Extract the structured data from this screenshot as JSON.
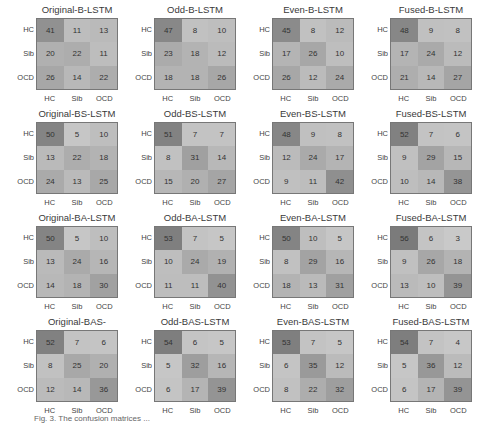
{
  "chart_data": [
    {
      "type": "heatmap",
      "title": "Original-B-LSTM",
      "x": [
        "HC",
        "Sib",
        "OCD"
      ],
      "y": [
        "HC",
        "Sib",
        "OCD"
      ],
      "values": [
        [
          41,
          11,
          13
        ],
        [
          20,
          22,
          11
        ],
        [
          26,
          14,
          22
        ]
      ]
    },
    {
      "type": "heatmap",
      "title": "Odd-B-LSTM",
      "x": [
        "HC",
        "Sib",
        "OCD"
      ],
      "y": [
        "HC",
        "Sib",
        "OCD"
      ],
      "values": [
        [
          47,
          8,
          10
        ],
        [
          23,
          18,
          12
        ],
        [
          18,
          18,
          26
        ]
      ]
    },
    {
      "type": "heatmap",
      "title": "Even-B-LSTM",
      "x": [
        "HC",
        "Sib",
        "OCD"
      ],
      "y": [
        "HC",
        "Sib",
        "OCD"
      ],
      "values": [
        [
          45,
          8,
          12
        ],
        [
          17,
          26,
          10
        ],
        [
          26,
          12,
          24
        ]
      ]
    },
    {
      "type": "heatmap",
      "title": "Fused-B-LSTM",
      "x": [
        "HC",
        "Sib",
        "OCD"
      ],
      "y": [
        "HC",
        "Sib",
        "OCD"
      ],
      "values": [
        [
          48,
          9,
          8
        ],
        [
          17,
          24,
          12
        ],
        [
          21,
          14,
          27
        ]
      ]
    },
    {
      "type": "heatmap",
      "title": "Original-BS-LSTM",
      "x": [
        "HC",
        "Sib",
        "OCD"
      ],
      "y": [
        "HC",
        "Sib",
        "OCD"
      ],
      "values": [
        [
          50,
          5,
          10
        ],
        [
          13,
          22,
          18
        ],
        [
          24,
          13,
          25
        ]
      ]
    },
    {
      "type": "heatmap",
      "title": "Odd-BS-LSTM",
      "x": [
        "HC",
        "Sib",
        "OCD"
      ],
      "y": [
        "HC",
        "Sib",
        "OCD"
      ],
      "values": [
        [
          51,
          7,
          7
        ],
        [
          8,
          31,
          14
        ],
        [
          15,
          20,
          27
        ]
      ]
    },
    {
      "type": "heatmap",
      "title": "Even-BS-LSTM",
      "x": [
        "HC",
        "Sib",
        "OCD"
      ],
      "y": [
        "HC",
        "Sib",
        "OCD"
      ],
      "values": [
        [
          48,
          9,
          8
        ],
        [
          12,
          24,
          17
        ],
        [
          9,
          11,
          42
        ]
      ]
    },
    {
      "type": "heatmap",
      "title": "Fused-BS-LSTM",
      "x": [
        "HC",
        "Sib",
        "OCD"
      ],
      "y": [
        "HC",
        "Sib",
        "OCD"
      ],
      "values": [
        [
          52,
          7,
          6
        ],
        [
          9,
          29,
          15
        ],
        [
          10,
          14,
          38
        ]
      ]
    },
    {
      "type": "heatmap",
      "title": "Original-BA-LSTM",
      "x": [
        "HC",
        "Sib",
        "OCD"
      ],
      "y": [
        "HC",
        "Sib",
        "OCD"
      ],
      "values": [
        [
          50,
          5,
          10
        ],
        [
          13,
          24,
          16
        ],
        [
          14,
          18,
          30
        ]
      ]
    },
    {
      "type": "heatmap",
      "title": "Odd-BA-LSTM",
      "x": [
        "HC",
        "Sib",
        "OCD"
      ],
      "y": [
        "HC",
        "Sib",
        "OCD"
      ],
      "values": [
        [
          53,
          7,
          5
        ],
        [
          10,
          24,
          19
        ],
        [
          11,
          11,
          40
        ]
      ]
    },
    {
      "type": "heatmap",
      "title": "Even-BA-LSTM",
      "x": [
        "HC",
        "Sib",
        "OCD"
      ],
      "y": [
        "HC",
        "Sib",
        "OCD"
      ],
      "values": [
        [
          50,
          10,
          5
        ],
        [
          8,
          29,
          16
        ],
        [
          18,
          13,
          31
        ]
      ]
    },
    {
      "type": "heatmap",
      "title": "Fused-BA-LSTM",
      "x": [
        "HC",
        "Sib",
        "OCD"
      ],
      "y": [
        "HC",
        "Sib",
        "OCD"
      ],
      "values": [
        [
          56,
          6,
          3
        ],
        [
          9,
          26,
          18
        ],
        [
          13,
          10,
          39
        ]
      ]
    },
    {
      "type": "heatmap",
      "title": "Original-BAS-LSTM",
      "x": [
        "HC",
        "Sib",
        "OCD"
      ],
      "y": [
        "HC",
        "Sib",
        "OCD"
      ],
      "values": [
        [
          52,
          7,
          6
        ],
        [
          8,
          25,
          20
        ],
        [
          12,
          14,
          36
        ]
      ]
    },
    {
      "type": "heatmap",
      "title": "Odd-BAS-LSTM",
      "x": [
        "HC",
        "Sib",
        "OCD"
      ],
      "y": [
        "HC",
        "Sib",
        "OCD"
      ],
      "values": [
        [
          54,
          6,
          5
        ],
        [
          5,
          32,
          16
        ],
        [
          6,
          17,
          39
        ]
      ]
    },
    {
      "type": "heatmap",
      "title": "Even-BAS-LSTM",
      "x": [
        "HC",
        "Sib",
        "OCD"
      ],
      "y": [
        "HC",
        "Sib",
        "OCD"
      ],
      "values": [
        [
          53,
          7,
          5
        ],
        [
          6,
          35,
          12
        ],
        [
          8,
          22,
          32
        ]
      ]
    },
    {
      "type": "heatmap",
      "title": "Fused-BAS-LSTM",
      "x": [
        "HC",
        "Sib",
        "OCD"
      ],
      "y": [
        "HC",
        "Sib",
        "OCD"
      ],
      "values": [
        [
          54,
          7,
          4
        ],
        [
          5,
          36,
          12
        ],
        [
          6,
          17,
          39
        ]
      ]
    }
  ],
  "caption": "Fig. 3. The confusion matrices ..."
}
